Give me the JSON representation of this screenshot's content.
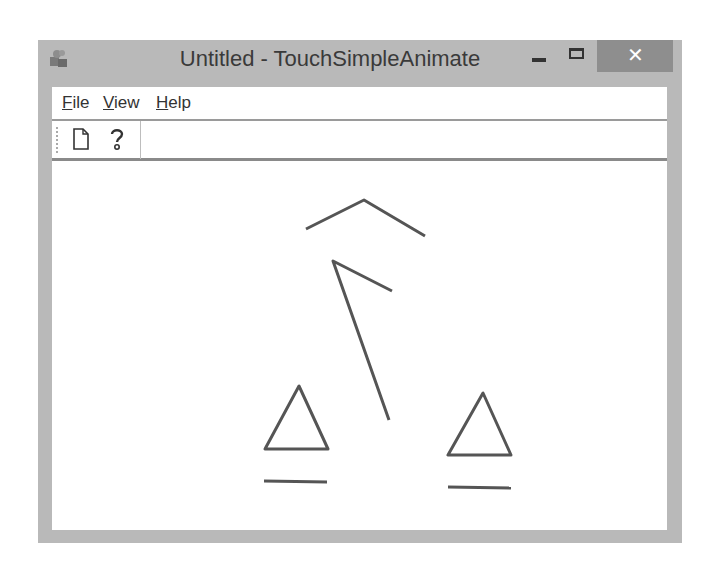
{
  "window": {
    "title": "Untitled - TouchSimpleAnimate",
    "controls": {
      "minimize_icon": "minimize-icon",
      "maximize_icon": "maximize-icon",
      "close_label": "✕"
    },
    "colors": {
      "frame": "#b9b9b9",
      "close_button": "#8e8e8e",
      "stroke": "#555555"
    }
  },
  "menubar": {
    "items": [
      {
        "label_underlined": "F",
        "label_rest": "ile"
      },
      {
        "label_underlined": "V",
        "label_rest": "iew"
      },
      {
        "label_underlined": "H",
        "label_rest": "elp"
      }
    ]
  },
  "toolbar": {
    "buttons": [
      {
        "icon": "new-document-icon",
        "tooltip": "New"
      },
      {
        "icon": "help-icon",
        "tooltip": "About"
      }
    ]
  },
  "canvas": {
    "shapes": [
      {
        "type": "polyline",
        "name": "chevron-top",
        "points": "254,68 312,39 373,75"
      },
      {
        "type": "polyline",
        "name": "arrow-stroke",
        "points": "340,130 281,100 337,259"
      },
      {
        "type": "polygon",
        "name": "triangle-left",
        "points": "247,225 213,288 276,288"
      },
      {
        "type": "line",
        "name": "underline-left",
        "points": "212,320 275,321"
      },
      {
        "type": "polygon",
        "name": "triangle-right",
        "points": "431,232 396,294 459,294"
      },
      {
        "type": "line",
        "name": "underline-right",
        "points": "396,326 459,327"
      }
    ]
  }
}
